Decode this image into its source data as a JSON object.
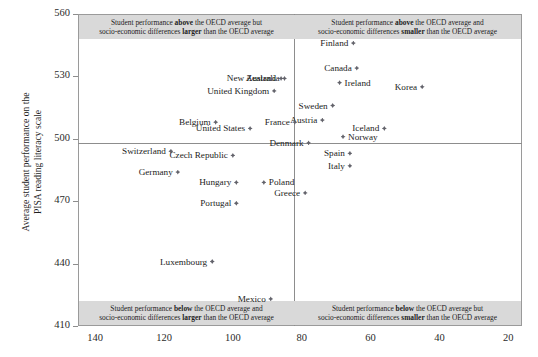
{
  "chart_data": {
    "type": "scatter",
    "title": "",
    "xlabel": "",
    "ylabel": "Average student performance on the\nPISA reading literacy scale",
    "xlim": [
      145,
      16
    ],
    "ylim": [
      410,
      560
    ],
    "x_reversed": true,
    "xticks": [
      140,
      120,
      100,
      80,
      60,
      40,
      20
    ],
    "yticks": [
      410,
      440,
      470,
      500,
      530,
      560
    ],
    "grid": false,
    "legend": "none",
    "reference_lines": {
      "horizontal_y": 500,
      "vertical_x": 80,
      "note": "OECD average lines"
    },
    "points": [
      {
        "name": "Finland",
        "x": 65,
        "y": 546,
        "label_side": "right"
      },
      {
        "name": "Australia",
        "x": 85,
        "y": 529,
        "label_side": "right"
      },
      {
        "name": "New Zealand",
        "x": 86,
        "y": 529,
        "label_side": "right"
      },
      {
        "name": "Canada",
        "x": 64,
        "y": 534,
        "label_side": "right"
      },
      {
        "name": "Ireland",
        "x": 69,
        "y": 527,
        "label_side": "left"
      },
      {
        "name": "Korea",
        "x": 45,
        "y": 525,
        "label_side": "right"
      },
      {
        "name": "United Kingdom",
        "x": 88,
        "y": 523,
        "label_side": "right"
      },
      {
        "name": "Sweden",
        "x": 71,
        "y": 516,
        "label_side": "right"
      },
      {
        "name": "Austria",
        "x": 74,
        "y": 509,
        "label_side": "right"
      },
      {
        "name": "Iceland",
        "x": 56,
        "y": 505,
        "label_side": "right"
      },
      {
        "name": "Belgium",
        "x": 105,
        "y": 508,
        "label_side": "right"
      },
      {
        "name": "France",
        "x": 82,
        "y": 508,
        "label_side": "right"
      },
      {
        "name": "United States",
        "x": 95,
        "y": 505,
        "label_side": "right"
      },
      {
        "name": "Norway",
        "x": 68,
        "y": 501,
        "label_side": "left"
      },
      {
        "name": "Denmark",
        "x": 78,
        "y": 498,
        "label_side": "right"
      },
      {
        "name": "Switzerland",
        "x": 118,
        "y": 494,
        "label_side": "right"
      },
      {
        "name": "Czech Republic",
        "x": 100,
        "y": 492,
        "label_side": "right"
      },
      {
        "name": "Spain",
        "x": 66,
        "y": 493,
        "label_side": "right"
      },
      {
        "name": "Italy",
        "x": 66,
        "y": 487,
        "label_side": "right"
      },
      {
        "name": "Germany",
        "x": 116,
        "y": 484,
        "label_side": "right"
      },
      {
        "name": "Poland",
        "x": 91,
        "y": 479,
        "label_side": "left"
      },
      {
        "name": "Hungary",
        "x": 99,
        "y": 479,
        "label_side": "right"
      },
      {
        "name": "Greece",
        "x": 79,
        "y": 474,
        "label_side": "right"
      },
      {
        "name": "Portugal",
        "x": 99,
        "y": 469,
        "label_side": "right"
      },
      {
        "name": "Luxembourg",
        "x": 106,
        "y": 441,
        "label_side": "right"
      },
      {
        "name": "Mexico",
        "x": 89,
        "y": 423,
        "label_side": "right"
      }
    ]
  },
  "quadrants": {
    "top_left": {
      "line1_pre": "Student performance ",
      "line1_bold": "above",
      "line1_post": " the OECD average but",
      "line2_pre": "socio-economic differences ",
      "line2_bold": "larger",
      "line2_post": " than the OECD average"
    },
    "top_right": {
      "line1_pre": "Student performance ",
      "line1_bold": "above",
      "line1_post": " the OECD average and",
      "line2_pre": "socio-economic differences ",
      "line2_bold": "smaller",
      "line2_post": " than the OECD average"
    },
    "bottom_left": {
      "line1_pre": "Student performance ",
      "line1_bold": "below",
      "line1_post": " the OECD average and",
      "line2_pre": "socio-economic differences ",
      "line2_bold": "larger",
      "line2_post": " than the OECD average"
    },
    "bottom_right": {
      "line1_pre": "Student performance ",
      "line1_bold": "below",
      "line1_post": " the OECD average but",
      "line2_pre": "socio-economic differences ",
      "line2_bold": "smaller",
      "line2_post": " than the OECD average"
    }
  },
  "axis_titles": {
    "y_line1": "Average student performance on the",
    "y_line2": "PISA reading literacy scale"
  }
}
